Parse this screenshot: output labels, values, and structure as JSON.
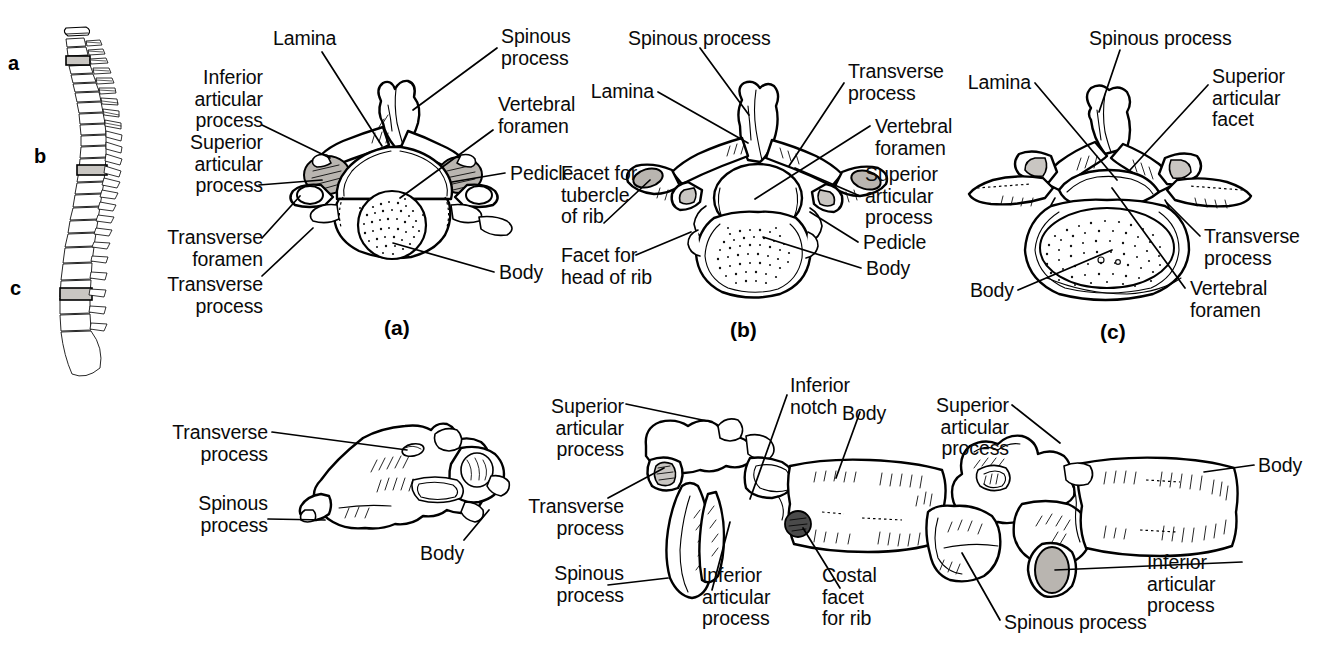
{
  "figure": {
    "background_color": "#ffffff",
    "line_color": "#000000",
    "shade_color": "#b9b5b0"
  },
  "spine": {
    "name": "vertebral-column-lateral-view",
    "markers": [
      {
        "label": "a",
        "region": "cervical"
      },
      {
        "label": "b",
        "region": "thoracic"
      },
      {
        "label": "c",
        "region": "lumbar"
      }
    ]
  },
  "panels": [
    {
      "id": "a",
      "caption": "(a)",
      "view": "superior",
      "region": "cervical vertebra",
      "labels": [
        {
          "text": "Lamina",
          "side": "top"
        },
        {
          "text": "Spinous\nprocess",
          "side": "top-right"
        },
        {
          "text": "Inferior\narticular\nprocess",
          "side": "left"
        },
        {
          "text": "Superior\narticular\nprocess",
          "side": "left"
        },
        {
          "text": "Transverse\nforamen",
          "side": "left"
        },
        {
          "text": "Transverse\nprocess",
          "side": "left"
        },
        {
          "text": "Vertebral\nforamen",
          "side": "right"
        },
        {
          "text": "Pedicle",
          "side": "right"
        },
        {
          "text": "Body",
          "side": "right"
        }
      ]
    },
    {
      "id": "b",
      "caption": "(b)",
      "view": "superior",
      "region": "thoracic vertebra",
      "labels": [
        {
          "text": "Spinous process",
          "side": "top"
        },
        {
          "text": "Lamina",
          "side": "left"
        },
        {
          "text": "Facet for\ntubercle\nof rib",
          "side": "left"
        },
        {
          "text": "Facet for\nhead of rib",
          "side": "left"
        },
        {
          "text": "Transverse\nprocess",
          "side": "right"
        },
        {
          "text": "Vertebral\nforamen",
          "side": "right"
        },
        {
          "text": "Superior\narticular\nprocess",
          "side": "right"
        },
        {
          "text": "Pedicle",
          "side": "right"
        },
        {
          "text": "Body",
          "side": "right"
        }
      ]
    },
    {
      "id": "c",
      "caption": "(c)",
      "view": "superior",
      "region": "lumbar vertebra",
      "labels": [
        {
          "text": "Spinous process",
          "side": "top"
        },
        {
          "text": "Lamina",
          "side": "left"
        },
        {
          "text": "Superior\narticular\nfacet",
          "side": "right"
        },
        {
          "text": "Transverse\nprocess",
          "side": "right"
        },
        {
          "text": "Body",
          "side": "left"
        },
        {
          "text": "Vertebral\nforamen",
          "side": "right"
        }
      ]
    },
    {
      "id": "d",
      "caption": "",
      "view": "lateral",
      "region": "cervical vertebra",
      "labels": [
        {
          "text": "Transverse\nprocess",
          "side": "left"
        },
        {
          "text": "Spinous\nprocess",
          "side": "left"
        },
        {
          "text": "Body",
          "side": "bottom-right"
        }
      ]
    },
    {
      "id": "e",
      "caption": "",
      "view": "lateral",
      "region": "thoracic vertebra",
      "labels": [
        {
          "text": "Superior\narticular\nprocess",
          "side": "left"
        },
        {
          "text": "Transverse\nprocess",
          "side": "left"
        },
        {
          "text": "Spinous\nprocess",
          "side": "left"
        },
        {
          "text": "Inferior\nnotch",
          "side": "top-right"
        },
        {
          "text": "Body",
          "side": "right"
        },
        {
          "text": "Inferior\narticular\nprocess",
          "side": "bottom"
        },
        {
          "text": "Costal\nfacet\nfor rib",
          "side": "bottom-right"
        }
      ]
    },
    {
      "id": "f",
      "caption": "",
      "view": "lateral",
      "region": "lumbar vertebra",
      "labels": [
        {
          "text": "Superior\narticular\nprocess",
          "side": "left"
        },
        {
          "text": "Body",
          "side": "right"
        },
        {
          "text": "Inferior\narticular\nprocess",
          "side": "right"
        },
        {
          "text": "Spinous process",
          "side": "bottom"
        }
      ]
    }
  ],
  "text": {
    "lamina": "Lamina",
    "spinous_process": "Spinous\nprocess",
    "spinous_process_inline": "Spinous process",
    "inferior_articular_process": "Inferior\narticular\nprocess",
    "superior_articular_process": "Superior\narticular\nprocess",
    "superior_articular_facet": "Superior\narticular\nfacet",
    "transverse_foramen": "Transverse\nforamen",
    "transverse_process": "Transverse\nprocess",
    "vertebral_foramen": "Vertebral\nforamen",
    "pedicle": "Pedicle",
    "body": "Body",
    "facet_tubercle_rib": "Facet for\ntubercle\nof rib",
    "facet_head_rib": "Facet for\nhead of rib",
    "inferior_notch": "Inferior\nnotch",
    "costal_facet_for_rib": "Costal\nfacet\nfor rib",
    "cap_a": "(a)",
    "cap_b": "(b)",
    "cap_c": "(c)",
    "mark_a": "a",
    "mark_b": "b",
    "mark_c": "c"
  }
}
